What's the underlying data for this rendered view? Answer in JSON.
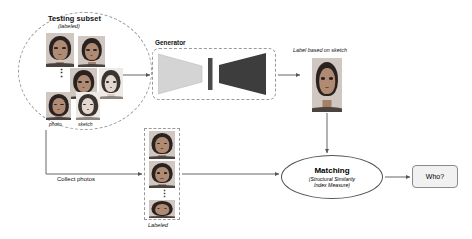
{
  "diagram": {
    "title_groups": {
      "testing_subset": {
        "title": "Testing subset",
        "subtitle": "(labeled)",
        "photo_label": "photo",
        "sketch_label": "sketch",
        "ellipsis": "⋮"
      },
      "generator": {
        "label": "Generator",
        "encoder_color": "#d4d4d4",
        "bottleneck_color": "#4a4a4a",
        "decoder_color": "#3d3d3d"
      },
      "generated": {
        "caption": "Label based on sketch"
      },
      "collect": {
        "label": "Collect photos",
        "gallery_label": "Labeled",
        "ellipsis": "⋮"
      },
      "matching": {
        "title": "Matching",
        "subtitle_line1": "(Structural Similarity",
        "subtitle_line2": "Index Measure)"
      },
      "result": {
        "label": "Who?"
      }
    },
    "colors": {
      "dashed_stroke": "#9a9a9a",
      "arrow_stroke": "#555555",
      "result_fill": "#f1f1f1",
      "text": "#111111"
    }
  }
}
